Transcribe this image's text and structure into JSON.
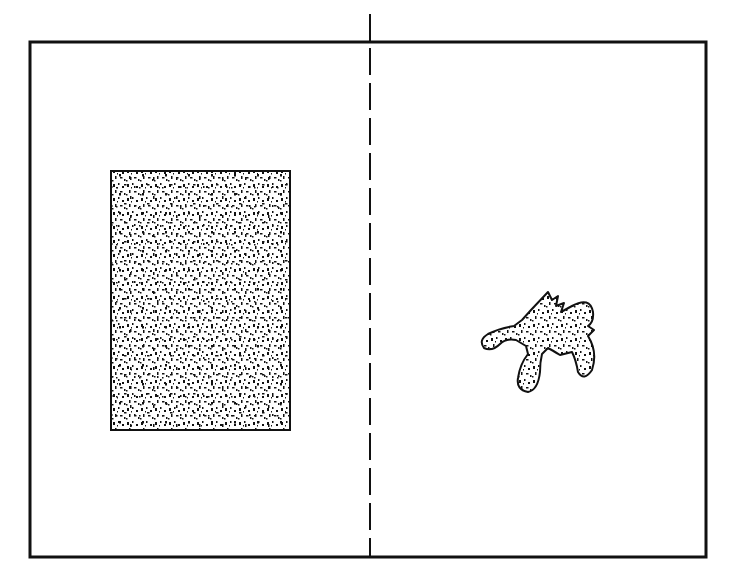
{
  "figure": {
    "background": "#ffffff",
    "stroke_color": "#111111",
    "frame": {
      "x": 30,
      "y": 42,
      "width": 676,
      "height": 515,
      "stroke_width": 3
    },
    "center_line": {
      "x": 370,
      "y1": 14,
      "y2": 557,
      "solid_top_end": 42,
      "dash": "27 8",
      "stroke_width": 2
    },
    "left_panel": {
      "shape": "rectangle",
      "fill_pattern": "stipple",
      "x": 111,
      "y": 171,
      "width": 179,
      "height": 259,
      "stroke_width": 2
    },
    "right_panel": {
      "shape": "irregular-blob",
      "fill_pattern": "stipple",
      "center": [
        535,
        340
      ]
    }
  }
}
